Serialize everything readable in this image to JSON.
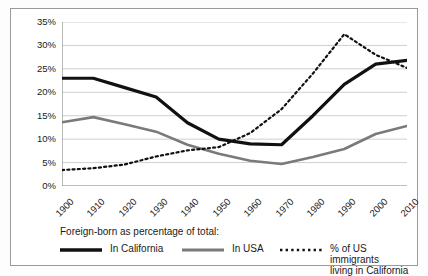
{
  "chart_data": {
    "type": "line",
    "title": "",
    "xlabel": "",
    "ylabel": "",
    "grid": true,
    "legend_position": "bottom",
    "legend_title": "Foreign-born as percentage of total:",
    "x": [
      1900,
      1910,
      1920,
      1930,
      1940,
      1950,
      1960,
      1970,
      1980,
      1990,
      2000,
      2010
    ],
    "categories": [
      "1900",
      "1910",
      "1920",
      "1930",
      "1940",
      "1950",
      "1960",
      "1970",
      "1980",
      "1990",
      "2000",
      "2010"
    ],
    "xlim": [
      1900,
      2010
    ],
    "ylim": [
      0,
      35
    ],
    "ytick_labels": [
      "0%",
      "5%",
      "10%",
      "15%",
      "20%",
      "25%",
      "30%",
      "35%"
    ],
    "ytick_values": [
      0,
      5,
      10,
      15,
      20,
      25,
      30,
      35
    ],
    "series": [
      {
        "name": "In California",
        "style": "solid",
        "color": "#111111",
        "width": 3.2,
        "values": [
          23.0,
          23.0,
          21.0,
          19.0,
          13.5,
          10.0,
          9.0,
          8.8,
          15.0,
          21.7,
          26.0,
          26.8
        ]
      },
      {
        "name": "In USA",
        "style": "solid",
        "color": "#7a7a7a",
        "width": 2.6,
        "values": [
          13.6,
          14.7,
          13.2,
          11.6,
          8.8,
          6.9,
          5.4,
          4.7,
          6.2,
          7.9,
          11.1,
          12.8
        ]
      },
      {
        "name": "% of US immigrants living in California",
        "style": "dotted",
        "color": "#111111",
        "width": 2.2,
        "values": [
          3.4,
          3.8,
          4.6,
          6.3,
          7.6,
          8.3,
          11.3,
          16.4,
          24.0,
          32.4,
          28.0,
          25.2
        ]
      }
    ]
  },
  "legend": {
    "title": "Foreign-born as percentage of total:",
    "items": [
      {
        "label": "In California",
        "label_line2": ""
      },
      {
        "label": "In USA",
        "label_line2": ""
      },
      {
        "label": "% of US immigrants",
        "label_line2": "living in California"
      }
    ]
  },
  "colors": {
    "california": "#111111",
    "usa": "#7a7a7a",
    "immigrant_share": "#111111",
    "grid": "#c9c9c9",
    "axis": "#7d7d7d",
    "frame": "#9a9a9a",
    "text": "#1a1a1a",
    "background": "#ffffff"
  }
}
